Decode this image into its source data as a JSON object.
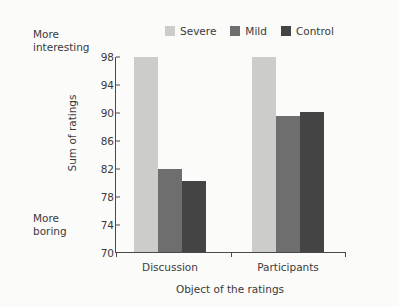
{
  "chart_data": {
    "type": "bar",
    "title": "",
    "xlabel": "Object of the ratings",
    "ylabel": "Sum of ratings",
    "categories": [
      "Discussion",
      "Participants"
    ],
    "series": [
      {
        "name": "Severe",
        "color": "#ccccca",
        "values": [
          97.8,
          97.9
        ]
      },
      {
        "name": "Mild",
        "color": "#6e6e6e",
        "values": [
          81.9,
          89.5
        ]
      },
      {
        "name": "Control",
        "color": "#444444",
        "values": [
          80.1,
          90.0
        ]
      }
    ],
    "ylim": [
      70,
      98
    ],
    "yticks": [
      70,
      74,
      78,
      82,
      86,
      90,
      94,
      98
    ],
    "ytick_labels": [
      "70",
      "74",
      "78",
      "82",
      "86",
      "90",
      "94",
      "98"
    ],
    "grid": false,
    "legend_position": "top-center",
    "annotations": [
      {
        "name": "more-interesting",
        "text": "More\ninteresting",
        "position": "top-left-outside"
      },
      {
        "name": "more-boring",
        "text": "More\nboring",
        "position": "bottom-left-outside"
      }
    ]
  },
  "axis_colors": {
    "axis_line": "#4a4a4a",
    "text": "#3a3a3a",
    "background": "#fbfbfa"
  }
}
